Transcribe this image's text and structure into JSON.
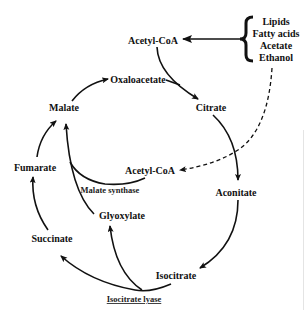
{
  "diagram": {
    "sources": {
      "items": [
        "Lipids",
        "Fatty acids",
        "Acetate",
        "Ethanol"
      ]
    },
    "nodes": {
      "acetyl_coa_top": "Acetyl-CoA",
      "oxaloacetate": "Oxaloacetate",
      "citrate": "Citrate",
      "aconitate": "Aconitate",
      "isocitrate": "Isocitrate",
      "succinate": "Succinate",
      "fumarate": "Fumarate",
      "malate": "Malate",
      "glyoxylate": "Glyoxylate",
      "acetyl_coa_inner": "Acetyl-CoA"
    },
    "enzymes": {
      "malate_synthase": "Malate synthase",
      "isocitrate_lyase": "Isocitrate lyase"
    },
    "edges": [
      {
        "from": "sources",
        "to": "acetyl_coa_top",
        "style": "solid"
      },
      {
        "from": "acetyl_coa_top",
        "to": "citrate",
        "style": "solid"
      },
      {
        "from": "oxaloacetate",
        "to": "citrate",
        "style": "solid"
      },
      {
        "from": "citrate",
        "to": "aconitate",
        "style": "solid"
      },
      {
        "from": "aconitate",
        "to": "isocitrate",
        "style": "solid"
      },
      {
        "from": "isocitrate",
        "to": "succinate",
        "style": "solid",
        "enzyme": "isocitrate_lyase"
      },
      {
        "from": "isocitrate",
        "to": "glyoxylate",
        "style": "solid",
        "enzyme": "isocitrate_lyase"
      },
      {
        "from": "succinate",
        "to": "fumarate",
        "style": "solid"
      },
      {
        "from": "fumarate",
        "to": "malate",
        "style": "solid"
      },
      {
        "from": "glyoxylate",
        "to": "malate",
        "style": "solid",
        "enzyme": "malate_synthase"
      },
      {
        "from": "acetyl_coa_inner",
        "to": "malate",
        "style": "solid",
        "enzyme": "malate_synthase"
      },
      {
        "from": "malate",
        "to": "oxaloacetate",
        "style": "solid"
      },
      {
        "from": "sources",
        "to": "acetyl_coa_inner",
        "style": "dashed"
      }
    ]
  }
}
